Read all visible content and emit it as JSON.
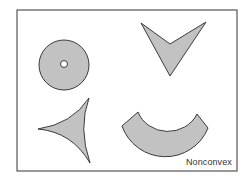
{
  "figure": {
    "caption": "Nonconvex",
    "colors": {
      "background": "#ffffff",
      "frame_stroke": "#555555",
      "shape_fill": "#c2c2c2",
      "shape_stroke": "#3a3a3a"
    },
    "shapes": [
      {
        "name": "annulus",
        "description": "disk with a small circular hole"
      },
      {
        "name": "chevron",
        "description": "V-shaped arrowhead pointing down"
      },
      {
        "name": "concave-triangle",
        "description": "three-pointed shape with inward-curved sides"
      },
      {
        "name": "arc-band",
        "description": "curved U-shaped band"
      }
    ]
  }
}
